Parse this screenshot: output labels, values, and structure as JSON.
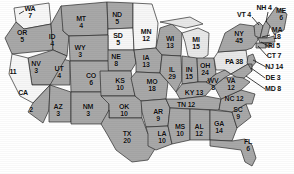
{
  "map": {
    "title": "United States Electoral Vote Map",
    "legend_shades": {
      "dark": "#8f8f8f",
      "mid": "#a8a8a8",
      "light": "#cfcfcf",
      "pale": "#e8e8e8",
      "white": "#f7f7f7",
      "outline": "#2b2b2b"
    },
    "states": [
      {
        "code": "WA",
        "votes": "7",
        "label": "WA\n7",
        "x": 30,
        "y": 12,
        "shade": "white"
      },
      {
        "code": "OR",
        "votes": "5",
        "label": "OR\n5",
        "x": 22,
        "y": 36,
        "shade": "mid"
      },
      {
        "code": "ID",
        "votes": "4",
        "label": "ID\n4",
        "x": 52,
        "y": 40,
        "shade": "mid"
      },
      {
        "code": "MT",
        "votes": "4",
        "label": "MT\n4",
        "x": 81,
        "y": 22,
        "shade": "mid"
      },
      {
        "code": "ND",
        "votes": "5",
        "label": "ND\n5",
        "x": 117,
        "y": 18,
        "shade": "mid"
      },
      {
        "code": "SD",
        "votes": "5",
        "label": "SD\n5",
        "x": 118,
        "y": 39,
        "shade": "white"
      },
      {
        "code": "MN",
        "votes": "12",
        "label": "MN\n12",
        "x": 146,
        "y": 35,
        "shade": "white"
      },
      {
        "code": "WI",
        "votes": "13",
        "label": "WI\n13",
        "x": 170,
        "y": 42,
        "shade": "mid"
      },
      {
        "code": "MI",
        "votes": "15",
        "label": "MI\n15",
        "x": 196,
        "y": 43,
        "shade": "pale"
      },
      {
        "code": "WY",
        "votes": "3",
        "label": "WY\n3",
        "x": 80,
        "y": 51,
        "shade": "mid"
      },
      {
        "code": "NE",
        "votes": "8",
        "label": "NE\n8",
        "x": 116,
        "y": 60,
        "shade": "mid"
      },
      {
        "code": "IA",
        "votes": "13",
        "label": "IA\n13",
        "x": 146,
        "y": 61,
        "shade": "mid"
      },
      {
        "code": "NV",
        "votes": "3",
        "label": "NV\n3",
        "x": 36,
        "y": 67,
        "shade": "mid"
      },
      {
        "code": "UT",
        "votes": "4",
        "label": "UT\n4",
        "x": 59,
        "y": 72,
        "shade": "mid"
      },
      {
        "code": "CO",
        "votes": "6",
        "label": "CO\n6",
        "x": 91,
        "y": 79,
        "shade": "mid"
      },
      {
        "code": "KS",
        "votes": "10",
        "label": "KS\n10",
        "x": 120,
        "y": 84,
        "shade": "mid"
      },
      {
        "code": "MO",
        "votes": "18",
        "label": "MO\n18",
        "x": 152,
        "y": 85,
        "shade": "mid"
      },
      {
        "code": "IL",
        "votes": "29",
        "label": "IL\n29",
        "x": 172,
        "y": 73,
        "shade": "mid"
      },
      {
        "code": "IN",
        "votes": "15",
        "label": "IN\n15",
        "x": 189,
        "y": 73,
        "shade": "mid"
      },
      {
        "code": "OH",
        "votes": "24",
        "label": "OH\n24",
        "x": 205,
        "y": 69,
        "shade": "mid"
      },
      {
        "code": "CA",
        "votes": "11",
        "label": "11",
        "x": 13,
        "y": 72,
        "shade": "white"
      },
      {
        "code": "CA-name",
        "votes": "",
        "label": "CA",
        "x": 23,
        "y": 93,
        "shade": "white"
      },
      {
        "code": "CA-s",
        "votes": "2",
        "label": "2",
        "x": 31,
        "y": 110,
        "shade": "mid"
      },
      {
        "code": "AZ",
        "votes": "3",
        "label": "AZ\n3",
        "x": 58,
        "y": 110,
        "shade": "mid"
      },
      {
        "code": "NM",
        "votes": "3",
        "label": "NM\n3",
        "x": 88,
        "y": 110,
        "shade": "mid"
      },
      {
        "code": "OK",
        "votes": "10",
        "label": "OK\n10",
        "x": 124,
        "y": 110,
        "shade": "mid"
      },
      {
        "code": "TX",
        "votes": "20",
        "label": "TX\n20",
        "x": 127,
        "y": 137,
        "shade": "mid"
      },
      {
        "code": "AR",
        "votes": "9",
        "label": "AR\n9",
        "x": 158,
        "y": 115,
        "shade": "mid"
      },
      {
        "code": "LA",
        "votes": "10",
        "label": "LA\n10",
        "x": 162,
        "y": 137,
        "shade": "mid"
      },
      {
        "code": "MS",
        "votes": "10",
        "label": "MS\n10",
        "x": 180,
        "y": 130,
        "shade": "mid"
      },
      {
        "code": "AL",
        "votes": "12",
        "label": "AL\n12",
        "x": 199,
        "y": 130,
        "shade": "mid"
      },
      {
        "code": "GA",
        "votes": "14",
        "label": "GA\n14",
        "x": 219,
        "y": 127,
        "shade": "mid"
      },
      {
        "code": "FL",
        "votes": "6",
        "label": "FL\n6",
        "x": 248,
        "y": 145,
        "shade": "mid"
      },
      {
        "code": "TN",
        "votes": "12",
        "label": "TN 12",
        "x": 186,
        "y": 105,
        "shade": "mid"
      },
      {
        "code": "KY",
        "votes": "13",
        "label": "KY 13",
        "x": 194,
        "y": 93,
        "shade": "mid"
      },
      {
        "code": "WV",
        "votes": "8",
        "label": "WV\n8",
        "x": 213,
        "y": 84,
        "shade": "mid"
      },
      {
        "code": "VA",
        "votes": "12",
        "label": "VA\n12",
        "x": 231,
        "y": 84,
        "shade": "mid"
      },
      {
        "code": "NC",
        "votes": "12",
        "label": "NC 12",
        "x": 234,
        "y": 99,
        "shade": "mid"
      },
      {
        "code": "SC",
        "votes": "9",
        "label": "SC\n9",
        "x": 238,
        "y": 113,
        "shade": "mid"
      },
      {
        "code": "PA",
        "votes": "38",
        "label": "PA 38",
        "x": 234,
        "y": 62,
        "shade": "pale"
      },
      {
        "code": "NY",
        "votes": "45",
        "label": "NY\n45",
        "x": 239,
        "y": 37,
        "shade": "mid"
      },
      {
        "code": "VT",
        "votes": "4",
        "label": "VT 4",
        "x": 244,
        "y": 15,
        "shade": "mid"
      },
      {
        "code": "NH",
        "votes": "4",
        "label": "NH 4",
        "x": 264,
        "y": 8,
        "shade": "mid"
      },
      {
        "code": "ME",
        "votes": "6",
        "label": "ME\n6",
        "x": 281,
        "y": 14,
        "shade": "mid"
      },
      {
        "code": "MA",
        "votes": "18",
        "label": "MA\n18",
        "x": 277,
        "y": 33,
        "shade": "mid"
      },
      {
        "code": "RI",
        "votes": "5",
        "label": "RI 5",
        "x": 274,
        "y": 46,
        "shade": "mid"
      },
      {
        "code": "CT",
        "votes": "7",
        "label": "CT 7",
        "x": 274,
        "y": 56,
        "shade": "mid"
      },
      {
        "code": "NJ",
        "votes": "14",
        "label": "NJ 14",
        "x": 274,
        "y": 67,
        "shade": "mid"
      },
      {
        "code": "DE",
        "votes": "3",
        "label": "DE 3",
        "x": 273,
        "y": 78,
        "shade": "mid"
      },
      {
        "code": "MD",
        "votes": "8",
        "label": "MD 8",
        "x": 273,
        "y": 89,
        "shade": "mid"
      }
    ],
    "leaders": [
      {
        "name": "leader-vt",
        "x1": 252,
        "y1": 17,
        "x2": 259,
        "y2": 25
      },
      {
        "name": "leader-nh",
        "x1": 268,
        "y1": 12,
        "x2": 266,
        "y2": 22
      },
      {
        "name": "leader-ma",
        "x1": 270,
        "y1": 35,
        "x2": 262,
        "y2": 35
      },
      {
        "name": "leader-ri",
        "x1": 268,
        "y1": 46,
        "x2": 261,
        "y2": 41
      },
      {
        "name": "leader-ct",
        "x1": 267,
        "y1": 56,
        "x2": 257,
        "y2": 44
      },
      {
        "name": "leader-nj",
        "x1": 266,
        "y1": 67,
        "x2": 252,
        "y2": 58
      },
      {
        "name": "leader-de",
        "x1": 265,
        "y1": 78,
        "x2": 250,
        "y2": 67
      },
      {
        "name": "leader-md",
        "x1": 265,
        "y1": 89,
        "x2": 246,
        "y2": 74
      }
    ]
  }
}
